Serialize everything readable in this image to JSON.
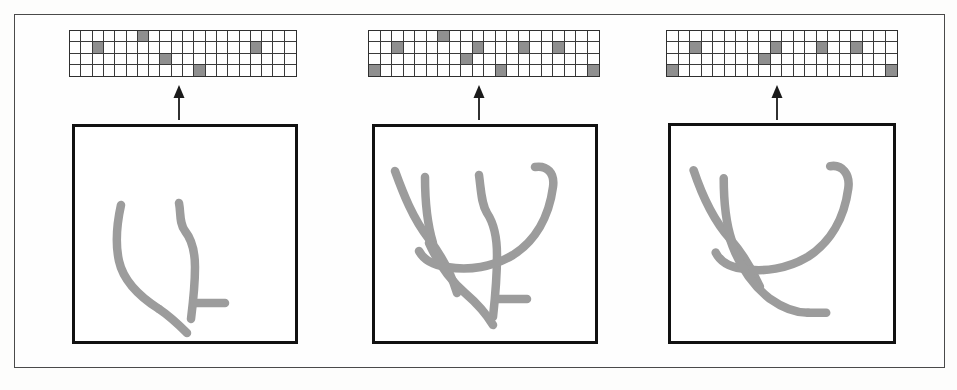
{
  "figure": {
    "panel_count": 3,
    "stroke_color": "#9c9c9c",
    "grid_on_color": "#8f8f8f",
    "grid_off_color": "#ffffff",
    "grid_line_color": "#3a3a3a",
    "box_border_color": "#111111",
    "frame_color": "#4a4a4a",
    "arrow_color": "#1a1a1a",
    "arrow_label": "derives-from"
  },
  "panels": [
    {
      "id": "panel-1",
      "name": "stage-1",
      "grid": {
        "columns": 20,
        "rows": 4,
        "on_cells": [
          [
            0,
            6
          ],
          [
            1,
            2
          ],
          [
            1,
            16
          ],
          [
            2,
            8
          ],
          [
            3,
            11
          ]
        ],
        "on_count": 5
      },
      "sketch": {
        "name": "sketch-stage-1",
        "stroke_count": 3,
        "paths": [
          "M 46 78 C 42 96 40 116 44 134 C 48 152 62 168 84 182",
          "M 104 76 C 106 86 104 96 110 104 C 118 114 120 126 120 140 C 120 158 118 176 116 192",
          "M 84 182 C 96 190 104 198 112 206"
        ],
        "extra_paths": [
          "M 120 176 L 150 176"
        ]
      }
    },
    {
      "id": "panel-2",
      "name": "stage-2",
      "grid": {
        "columns": 20,
        "rows": 4,
        "on_cells": [
          [
            0,
            6
          ],
          [
            1,
            2
          ],
          [
            1,
            9
          ],
          [
            1,
            13
          ],
          [
            1,
            16
          ],
          [
            2,
            8
          ],
          [
            3,
            0
          ],
          [
            3,
            11
          ],
          [
            3,
            19
          ]
        ],
        "on_count": 9
      },
      "sketch": {
        "name": "sketch-stage-2",
        "stroke_count": 6,
        "paths": [
          "M 20 44 C 28 66 38 92 54 112 C 66 128 76 146 82 166",
          "M 50 50 C 50 72 52 96 58 116",
          "M 104 48 C 106 62 106 76 112 86 C 120 98 122 112 122 128 C 122 150 120 172 118 190",
          "M 160 40 C 172 38 180 46 178 60 C 174 90 160 114 138 128 C 118 140 94 144 72 140 C 58 138 48 132 44 124",
          "M 54 116 C 62 134 74 152 90 166 C 104 178 112 188 118 198",
          "M 122 172 L 152 172"
        ]
      }
    },
    {
      "id": "panel-3",
      "name": "stage-3",
      "grid": {
        "columns": 20,
        "rows": 4,
        "on_cells": [
          [
            1,
            2
          ],
          [
            1,
            9
          ],
          [
            1,
            13
          ],
          [
            1,
            16
          ],
          [
            2,
            8
          ],
          [
            3,
            0
          ],
          [
            3,
            19
          ]
        ],
        "on_count": 7
      },
      "sketch": {
        "name": "sketch-stage-3",
        "stroke_count": 4,
        "paths": [
          "M 22 44 C 30 68 42 94 58 112 C 70 126 80 142 88 160",
          "M 52 52 C 52 74 54 96 60 114",
          "M 158 40 C 170 38 178 48 176 62 C 172 92 158 116 136 130 C 116 142 92 146 70 142 C 56 140 48 134 44 126",
          "M 58 112 C 66 136 80 158 98 172 C 112 182 124 186 136 186",
          "M 136 186 L 154 186"
        ]
      }
    }
  ]
}
